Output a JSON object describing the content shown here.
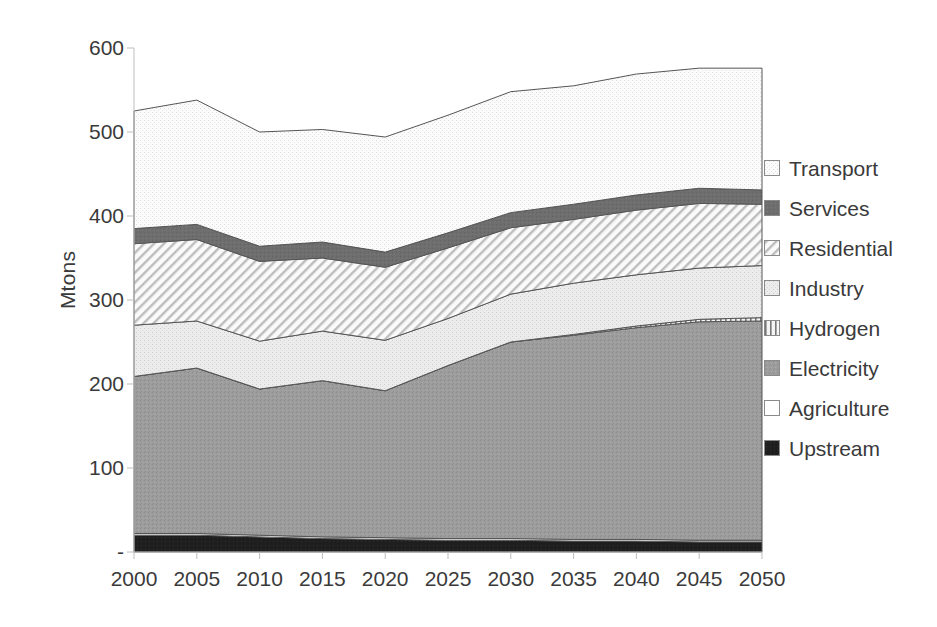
{
  "chart_data": {
    "type": "area",
    "stacked": true,
    "title": "",
    "xlabel": "",
    "ylabel": "Mtons",
    "x": [
      2000,
      2005,
      2010,
      2015,
      2020,
      2025,
      2030,
      2035,
      2040,
      2045,
      2050
    ],
    "categories": [
      "2000",
      "2005",
      "2010",
      "2015",
      "2020",
      "2025",
      "2030",
      "2035",
      "2040",
      "2045",
      "2050"
    ],
    "ylim": [
      0,
      600
    ],
    "yticks": [
      0,
      100,
      200,
      300,
      400,
      500,
      600
    ],
    "ytick_labels": [
      "-",
      "100",
      "200",
      "300",
      "400",
      "500",
      "600"
    ],
    "grid": false,
    "legend_position": "right",
    "stack_order_bottom_to_top": [
      "Upstream",
      "Agriculture",
      "Electricity",
      "Hydrogen",
      "Industry",
      "Residential",
      "Services",
      "Transport"
    ],
    "series": [
      {
        "name": "Upstream",
        "pattern": "solid-black",
        "color": "#1a1a1a",
        "values": [
          20,
          20,
          18,
          16,
          15,
          14,
          14,
          13,
          13,
          12,
          12
        ]
      },
      {
        "name": "Agriculture",
        "pattern": "white",
        "color": "#ffffff",
        "values": [
          2,
          2,
          2,
          2,
          2,
          2,
          2,
          2,
          2,
          2,
          2
        ]
      },
      {
        "name": "Electricity",
        "pattern": "medium-gray-stipple",
        "color": "#9a9a9a",
        "values": [
          187,
          197,
          174,
          186,
          175,
          206,
          234,
          243,
          252,
          260,
          261
        ]
      },
      {
        "name": "Hydrogen",
        "pattern": "vertical-lines",
        "color": "#d8d8d8",
        "values": [
          0,
          0,
          0,
          0,
          0,
          0,
          0,
          1,
          2,
          3,
          4
        ]
      },
      {
        "name": "Industry",
        "pattern": "light-gray-stipple",
        "color": "#e9e9e9",
        "values": [
          61,
          56,
          57,
          59,
          60,
          56,
          57,
          61,
          61,
          61,
          62
        ]
      },
      {
        "name": "Residential",
        "pattern": "diagonal-hatch",
        "color": "#f2f2f2",
        "values": [
          97,
          97,
          95,
          87,
          87,
          84,
          79,
          76,
          77,
          77,
          73
        ]
      },
      {
        "name": "Services",
        "pattern": "dark-gray-solid",
        "color": "#6e6e6e",
        "values": [
          18,
          18,
          18,
          19,
          18,
          18,
          18,
          18,
          18,
          18,
          17
        ]
      },
      {
        "name": "Transport",
        "pattern": "very-light-stipple",
        "color": "#f7f7f7",
        "values": [
          140,
          148,
          136,
          134,
          137,
          140,
          144,
          141,
          144,
          143,
          145
        ]
      }
    ],
    "totals": [
      525,
      538,
      500,
      503,
      494,
      520,
      548,
      555,
      569,
      576,
      576
    ]
  },
  "legend": {
    "items": [
      {
        "label": "Transport",
        "swatch": "very-light-stipple"
      },
      {
        "label": "Services",
        "swatch": "dark-gray-solid"
      },
      {
        "label": "Residential",
        "swatch": "diagonal-hatch"
      },
      {
        "label": "Industry",
        "swatch": "light-gray-stipple"
      },
      {
        "label": "Hydrogen",
        "swatch": "vertical-lines"
      },
      {
        "label": "Electricity",
        "swatch": "medium-gray-stipple"
      },
      {
        "label": "Agriculture",
        "swatch": "white"
      },
      {
        "label": "Upstream",
        "swatch": "solid-black"
      }
    ]
  }
}
